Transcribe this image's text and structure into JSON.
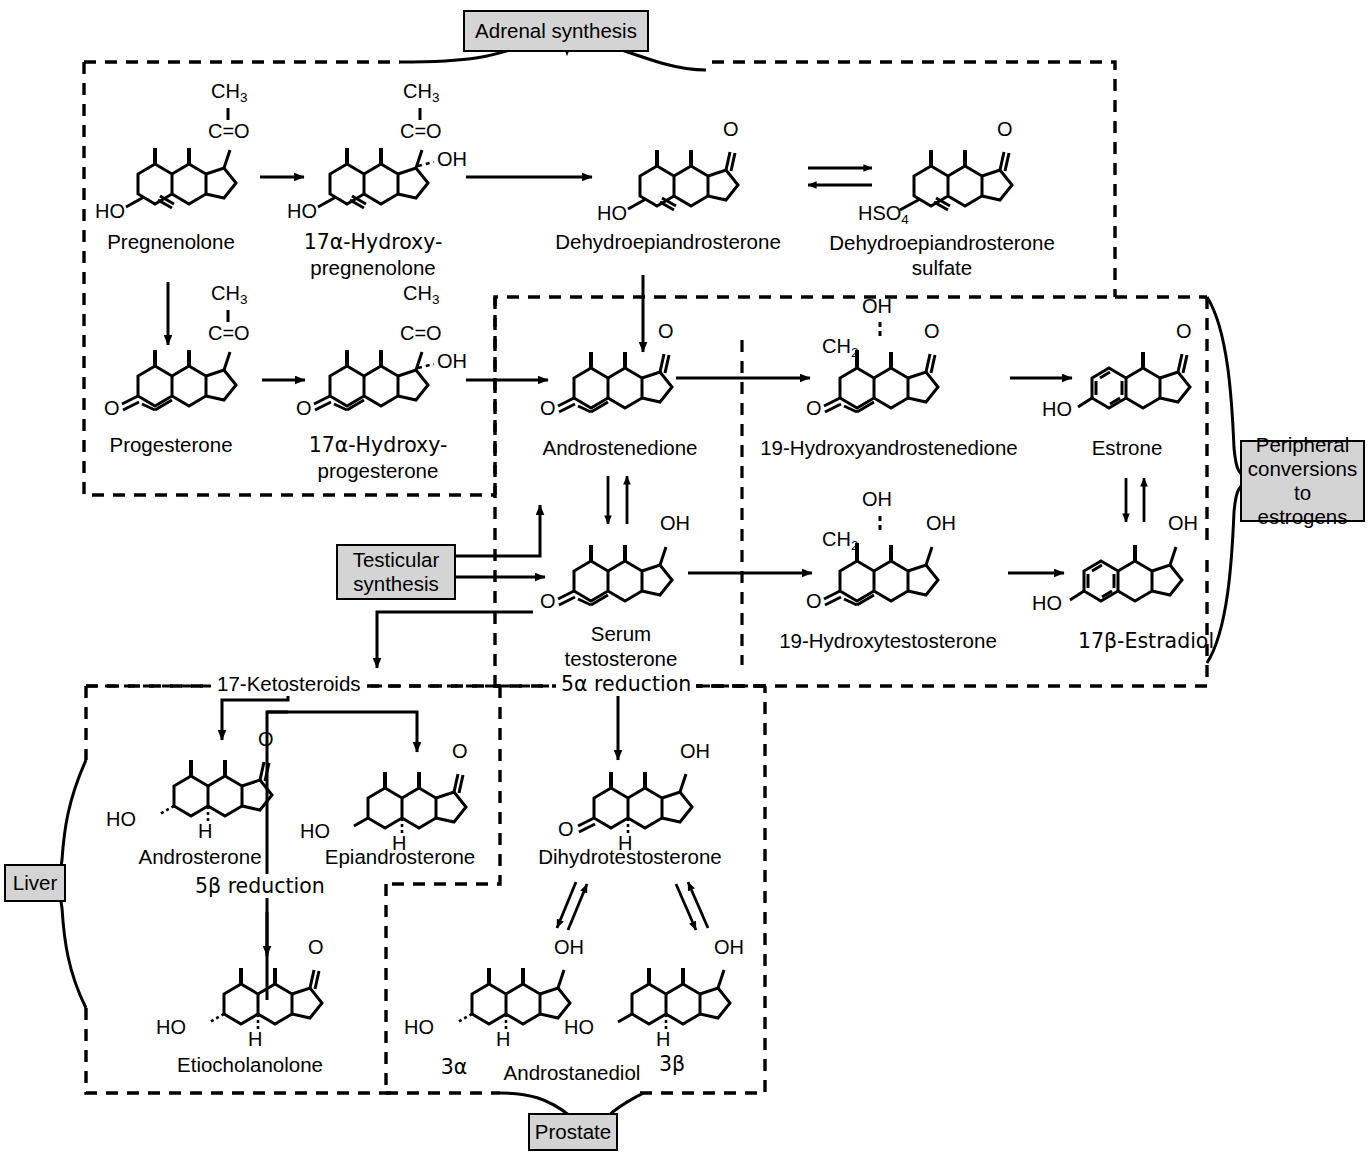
{
  "diagram": {
    "type": "biochemical-pathway"
  },
  "compartments": [
    {
      "id": "adrenal",
      "label": "Adrenal synthesis"
    },
    {
      "id": "testicular",
      "label": "Testicular synthesis"
    },
    {
      "id": "peripheral",
      "label": "Peripheral conversions to estrogens"
    },
    {
      "id": "liver",
      "label": "Liver"
    },
    {
      "id": "prostate",
      "label": "Prostate"
    }
  ],
  "tags": {
    "adrenal": "Adrenal synthesis",
    "testicular_line1": "Testicular",
    "testicular_line2": "synthesis",
    "peripheral_line1": "Peripheral",
    "peripheral_line2": "conversions",
    "peripheral_line3": "to estrogens",
    "liver": "Liver",
    "prostate": "Prostate"
  },
  "pathway_labels": {
    "ketosteroids": "17-Ketosteroids",
    "five_alpha": "5α reduction",
    "five_beta": "5β reduction"
  },
  "compounds": [
    {
      "id": "pregnenolone",
      "name": "Pregnenolone",
      "groups": [
        "CH3",
        "C=O",
        "HO"
      ]
    },
    {
      "id": "17a-hydroxypregnenolone",
      "name_line1": "17α-Hydroxy-",
      "name_line2": "pregnenolone",
      "groups": [
        "CH3",
        "C=O",
        "OH",
        "HO"
      ]
    },
    {
      "id": "dhea",
      "name": "Dehydroepiandrosterone",
      "groups": [
        "O",
        "HO"
      ]
    },
    {
      "id": "dhea-sulfate",
      "name_line1": "Dehydroepiandrosterone",
      "name_line2": "sulfate",
      "groups": [
        "O",
        "HSO4"
      ]
    },
    {
      "id": "progesterone",
      "name": "Progesterone",
      "groups": [
        "CH3",
        "C=O",
        "O"
      ]
    },
    {
      "id": "17a-hydroxyprogesterone",
      "name_line1": "17α-Hydroxy-",
      "name_line2": "progesterone",
      "groups": [
        "CH3",
        "C=O",
        "OH",
        "O"
      ]
    },
    {
      "id": "androstenedione",
      "name": "Androstenedione",
      "groups": [
        "O",
        "O"
      ]
    },
    {
      "id": "19-hydroxyandrostenedione",
      "name": "19-Hydroxyandrostenedione",
      "groups": [
        "OH",
        "CH2",
        "O",
        "O"
      ]
    },
    {
      "id": "estrone",
      "name": "Estrone",
      "groups": [
        "O",
        "HO"
      ]
    },
    {
      "id": "testosterone",
      "name_line1": "Serum",
      "name_line2": "testosterone",
      "groups": [
        "OH",
        "O"
      ]
    },
    {
      "id": "19-hydroxytestosterone",
      "name": "19-Hydroxytestosterone",
      "groups": [
        "OH",
        "CH2",
        "OH",
        "O"
      ]
    },
    {
      "id": "17b-estradiol",
      "name": "17β-Estradiol",
      "groups": [
        "OH",
        "HO"
      ]
    },
    {
      "id": "androsterone",
      "name": "Androsterone",
      "groups": [
        "O",
        "HO",
        "H"
      ]
    },
    {
      "id": "epiandrosterone",
      "name": "Epiandrosterone",
      "groups": [
        "O",
        "HO",
        "H"
      ]
    },
    {
      "id": "dihydrotestosterone",
      "name": "Dihydrotestosterone",
      "groups": [
        "OH",
        "O",
        "H"
      ]
    },
    {
      "id": "etiocholanolone",
      "name": "Etiocholanolone",
      "groups": [
        "O",
        "HO",
        "H"
      ]
    },
    {
      "id": "androstanediol-3a",
      "name": "Androstanediol",
      "prefix": "3α",
      "groups": [
        "OH",
        "HO",
        "H"
      ]
    },
    {
      "id": "androstanediol-3b",
      "name": "Androstanediol",
      "suffix": "3β",
      "groups": [
        "OH",
        "HO",
        "H"
      ]
    }
  ],
  "atom_labels": {
    "CH": "CH",
    "C_eq_O": "C=O",
    "OH": "OH",
    "HO": "HO",
    "O": "O",
    "H": "H",
    "HSO": "HSO",
    "sub2": "2",
    "sub3": "3",
    "sub4": "4"
  },
  "names": {
    "pregnenolone": "Pregnenolone",
    "hydroxypregnenolone_1": "17α-Hydroxy-",
    "hydroxypregnenolone_2": "pregnenolone",
    "dhea": "Dehydroepiandrosterone",
    "dheas_1": "Dehydroepiandrosterone",
    "dheas_2": "sulfate",
    "progesterone": "Progesterone",
    "hydroxyprogesterone_1": "17α-Hydroxy-",
    "hydroxyprogesterone_2": "progesterone",
    "androstenedione": "Androstenedione",
    "hydroxyandrostenedione": "19-Hydroxyandrostenedione",
    "estrone": "Estrone",
    "testosterone_1": "Serum",
    "testosterone_2": "testosterone",
    "hydroxytestosterone": "19-Hydroxytestosterone",
    "estradiol": "17β-Estradiol",
    "androsterone": "Androsterone",
    "epiandrosterone": "Epiandrosterone",
    "dihydrotestosterone": "Dihydrotestosterone",
    "etiocholanolone": "Etiocholanolone",
    "androstanediol": "Androstanediol",
    "three_alpha": "3α",
    "three_beta": "3β"
  },
  "colors": {
    "tag_fill": "#d4d4d4",
    "stroke": "#000000",
    "background": "#ffffff"
  }
}
